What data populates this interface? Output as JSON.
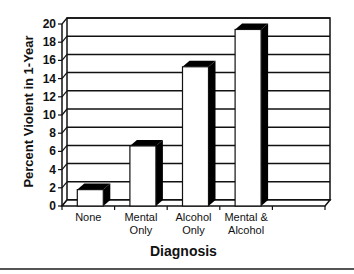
{
  "chart_data": {
    "type": "bar",
    "title": "",
    "xlabel": "Diagnosis",
    "ylabel": "Percent Violent in 1-Year",
    "categories": [
      "None",
      "Mental Only",
      "Alcohol Only",
      "Mental & Alcohol"
    ],
    "category_lines": [
      [
        "None"
      ],
      [
        "Mental",
        "Only"
      ],
      [
        "Alcohol",
        "Only"
      ],
      [
        "Mental &",
        "Alcohol"
      ]
    ],
    "values": [
      1.8,
      6.6,
      15.3,
      19.4
    ],
    "ylim": [
      0,
      20
    ],
    "yticks": [
      0,
      2,
      4,
      6,
      8,
      10,
      12,
      14,
      16,
      18,
      20
    ],
    "grid": true,
    "style": "3d-bar",
    "legend": null
  }
}
